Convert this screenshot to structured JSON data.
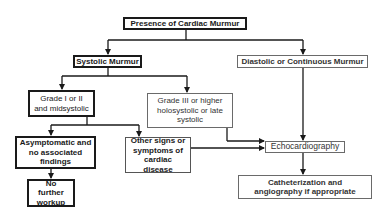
{
  "diagram": {
    "type": "flowchart",
    "nodes": {
      "root": {
        "label": "Presence of Cardiac Murmur"
      },
      "systolic": {
        "label": "Systolic Murmur"
      },
      "diastolic": {
        "label": "Diastolic or Continuous Murmur"
      },
      "grade12": {
        "label": "Grade I or II and midsystolic"
      },
      "grade3": {
        "label": "Grade III or higher holosystolic or late systolic"
      },
      "asymptomatic": {
        "label": "Asymptomatic and no associated findings"
      },
      "other_signs": {
        "label": "Other signs or symptoms of cardiac disease"
      },
      "no_further": {
        "label": "No further workup"
      },
      "echo": {
        "label": "Echocardiography"
      },
      "cath": {
        "label": "Catheterization and angiography if appropriate"
      }
    },
    "edges": [
      [
        "root",
        "systolic"
      ],
      [
        "root",
        "diastolic"
      ],
      [
        "systolic",
        "grade12"
      ],
      [
        "systolic",
        "grade3"
      ],
      [
        "grade12",
        "asymptomatic"
      ],
      [
        "grade12",
        "other_signs"
      ],
      [
        "asymptomatic",
        "no_further"
      ],
      [
        "grade3",
        "echo"
      ],
      [
        "other_signs",
        "echo"
      ],
      [
        "diastolic",
        "echo"
      ],
      [
        "echo",
        "cath"
      ]
    ]
  }
}
